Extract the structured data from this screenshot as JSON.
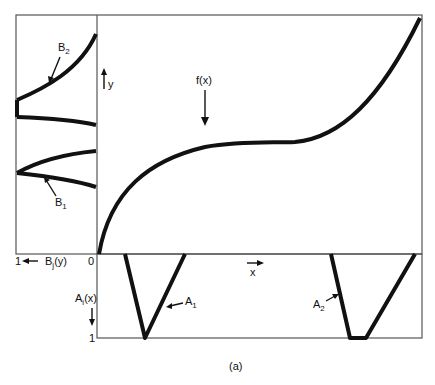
{
  "figure": {
    "caption": "(a)",
    "function_label": "f(x)",
    "y_axis_label": "y",
    "x_axis_label": "x",
    "origin_label": "0",
    "b_axis": {
      "one_label": "1",
      "label_main": "B",
      "label_sub": "j",
      "label_arg": "(y)"
    },
    "a_axis": {
      "one_label": "1",
      "label_main": "A",
      "label_sub": "i",
      "label_arg": "(x)"
    },
    "sets": {
      "B2": {
        "main": "B",
        "sub": "2"
      },
      "B1": {
        "main": "B",
        "sub": "1"
      },
      "A1": {
        "main": "A",
        "sub": "1"
      },
      "A2": {
        "main": "A",
        "sub": "2"
      }
    }
  }
}
